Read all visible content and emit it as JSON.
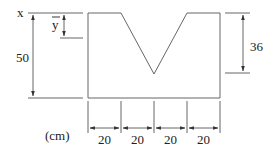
{
  "diagram": {
    "type": "cross-section-dimension-drawing",
    "unit_label": "(cm)",
    "axis_label": "x",
    "centroid_label": "y",
    "total_height_label": "50",
    "notch_depth_label": "36",
    "bottom_segments": [
      "20",
      "20",
      "20",
      "20"
    ],
    "dimensions": {
      "total_height_cm": 50,
      "notch_depth_cm": 36,
      "segment_width_cm": 20,
      "segment_count": 4
    }
  }
}
